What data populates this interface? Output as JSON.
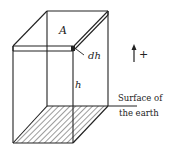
{
  "diagram": {
    "labels": {
      "area": "A",
      "thickness": "dh",
      "height": "h",
      "direction_sign": "+",
      "surface_line1": "Surface of",
      "surface_line2": "the earth"
    },
    "icons": {
      "direction": "up-arrow-icon"
    },
    "colors": {
      "stroke": "#222222",
      "background": "#ffffff"
    }
  }
}
